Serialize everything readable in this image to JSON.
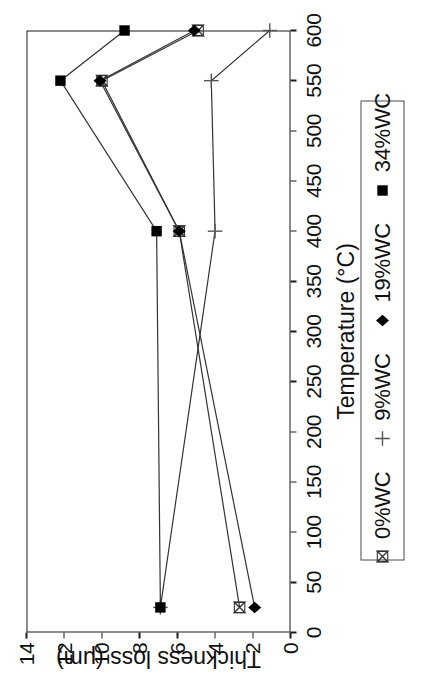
{
  "chart_data": {
    "type": "line",
    "title": "",
    "xlabel": "Temperature (°C)",
    "ylabel": "Thickness loss (μm)",
    "xlim": [
      0,
      600
    ],
    "ylim": [
      0,
      14
    ],
    "xticks": [
      0,
      50,
      100,
      150,
      200,
      250,
      300,
      350,
      400,
      450,
      500,
      550,
      600
    ],
    "yticks": [
      0,
      2,
      4,
      6,
      8,
      10,
      12,
      14
    ],
    "xtick_labels": [
      "0",
      "50",
      "100",
      "150",
      "200",
      "250",
      "300",
      "350",
      "400",
      "450",
      "500",
      "550",
      "600"
    ],
    "ytick_labels": [
      "0",
      "2",
      "4",
      "6",
      "8",
      "10",
      "12",
      "14"
    ],
    "grid": false,
    "legend_position": "below-axis",
    "x": [
      25,
      400,
      550,
      600
    ],
    "series": [
      {
        "name": "0%WC",
        "marker": "bowtie",
        "values": [
          2.7,
          5.9,
          10.0,
          4.9
        ]
      },
      {
        "name": "9%WC",
        "marker": "plus",
        "values": [
          6.9,
          4.0,
          4.2,
          1.1
        ]
      },
      {
        "name": "19%WC",
        "marker": "diamond",
        "values": [
          1.9,
          5.9,
          10.1,
          5.1
        ]
      },
      {
        "name": "34%WC",
        "marker": "square",
        "values": [
          6.9,
          7.1,
          12.2,
          8.8
        ]
      }
    ]
  },
  "axes": {
    "x_title": "Temperature (°C)",
    "y_title": "Thickness loss (μm)"
  },
  "legend": {
    "entries": [
      {
        "label": "0%WC",
        "marker": "bowtie-marker"
      },
      {
        "label": "9%WC",
        "marker": "plus-marker"
      },
      {
        "label": "19%WC",
        "marker": "diamond-marker"
      },
      {
        "label": "34%WC",
        "marker": "square-marker"
      }
    ]
  },
  "colors": {
    "line": "#333333",
    "marker": "#000000",
    "frame": "#1a1a1a",
    "text": "#111111",
    "background": "#ffffff"
  }
}
